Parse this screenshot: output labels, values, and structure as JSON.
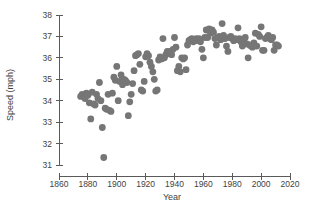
{
  "chart_data": {
    "type": "scatter",
    "title": "",
    "xlabel": "Year",
    "ylabel": "Speed (mph)",
    "xlim": [
      1860,
      2020
    ],
    "ylim": [
      31,
      38
    ],
    "xticks": [
      1860,
      1880,
      1900,
      1920,
      1940,
      1960,
      1980,
      2000,
      2020
    ],
    "yticks": [
      31,
      32,
      33,
      34,
      35,
      36,
      37,
      38
    ],
    "grid": false,
    "legend": null,
    "marker_color": "#767676",
    "marker_size": 3.4,
    "points": [
      [
        1875,
        34.2
      ],
      [
        1876,
        34.3
      ],
      [
        1877,
        34.2
      ],
      [
        1878,
        34.1
      ],
      [
        1879,
        34.35
      ],
      [
        1880,
        34.25
      ],
      [
        1881,
        33.9
      ],
      [
        1882,
        33.15
      ],
      [
        1883,
        34.4
      ],
      [
        1884,
        33.85
      ],
      [
        1885,
        33.8
      ],
      [
        1886,
        34.3
      ],
      [
        1887,
        34.1
      ],
      [
        1888,
        34.85
      ],
      [
        1889,
        34.0
      ],
      [
        1890,
        32.75
      ],
      [
        1891,
        31.35
      ],
      [
        1892,
        33.65
      ],
      [
        1893,
        33.6
      ],
      [
        1894,
        34.3
      ],
      [
        1895,
        33.55
      ],
      [
        1896,
        33.5
      ],
      [
        1897,
        34.35
      ],
      [
        1898,
        35.1
      ],
      [
        1899,
        34.95
      ],
      [
        1900,
        35.6
      ],
      [
        1901,
        34.0
      ],
      [
        1902,
        34.9
      ],
      [
        1903,
        35.2
      ],
      [
        1904,
        34.75
      ],
      [
        1905,
        35.0
      ],
      [
        1906,
        34.95
      ],
      [
        1907,
        34.85
      ],
      [
        1908,
        33.3
      ],
      [
        1909,
        33.95
      ],
      [
        1910,
        34.3
      ],
      [
        1911,
        34.8
      ],
      [
        1912,
        35.4
      ],
      [
        1913,
        36.1
      ],
      [
        1914,
        36.15
      ],
      [
        1915,
        36.2
      ],
      [
        1916,
        35.7
      ],
      [
        1917,
        34.5
      ],
      [
        1918,
        34.45
      ],
      [
        1919,
        34.9
      ],
      [
        1920,
        36.05
      ],
      [
        1921,
        36.2
      ],
      [
        1922,
        36.1
      ],
      [
        1923,
        35.8
      ],
      [
        1924,
        35.6
      ],
      [
        1925,
        35.35
      ],
      [
        1926,
        35.0
      ],
      [
        1927,
        34.45
      ],
      [
        1928,
        34.5
      ],
      [
        1929,
        35.9
      ],
      [
        1930,
        36.05
      ],
      [
        1931,
        35.95
      ],
      [
        1932,
        36.9
      ],
      [
        1933,
        36.0
      ],
      [
        1934,
        36.15
      ],
      [
        1935,
        36.3
      ],
      [
        1936,
        36.2
      ],
      [
        1937,
        36.3
      ],
      [
        1938,
        36.15
      ],
      [
        1939,
        36.4
      ],
      [
        1940,
        36.95
      ],
      [
        1941,
        36.5
      ],
      [
        1942,
        35.4
      ],
      [
        1943,
        35.6
      ],
      [
        1944,
        35.35
      ],
      [
        1945,
        36.0
      ],
      [
        1946,
        35.95
      ],
      [
        1947,
        36.0
      ],
      [
        1948,
        35.45
      ],
      [
        1949,
        36.6
      ],
      [
        1950,
        36.8
      ],
      [
        1951,
        36.85
      ],
      [
        1952,
        36.9
      ],
      [
        1953,
        36.75
      ],
      [
        1954,
        36.85
      ],
      [
        1955,
        36.9
      ],
      [
        1956,
        36.8
      ],
      [
        1957,
        36.9
      ],
      [
        1958,
        36.75
      ],
      [
        1959,
        36.4
      ],
      [
        1960,
        36.0
      ],
      [
        1961,
        36.95
      ],
      [
        1962,
        37.3
      ],
      [
        1963,
        36.95
      ],
      [
        1964,
        37.35
      ],
      [
        1965,
        37.15
      ],
      [
        1966,
        37.3
      ],
      [
        1967,
        37.2
      ],
      [
        1968,
        36.9
      ],
      [
        1969,
        36.6
      ],
      [
        1970,
        36.95
      ],
      [
        1971,
        37.0
      ],
      [
        1972,
        36.85
      ],
      [
        1973,
        37.6
      ],
      [
        1974,
        37.05
      ],
      [
        1975,
        36.9
      ],
      [
        1976,
        36.55
      ],
      [
        1977,
        36.3
      ],
      [
        1978,
        36.95
      ],
      [
        1979,
        37.0
      ],
      [
        1980,
        36.9
      ],
      [
        1981,
        36.8
      ],
      [
        1982,
        36.9
      ],
      [
        1983,
        36.85
      ],
      [
        1984,
        37.4
      ],
      [
        1985,
        36.9
      ],
      [
        1986,
        36.75
      ],
      [
        1987,
        36.55
      ],
      [
        1988,
        36.8
      ],
      [
        1989,
        36.95
      ],
      [
        1990,
        36.65
      ],
      [
        1991,
        36.0
      ],
      [
        1992,
        36.6
      ],
      [
        1993,
        36.55
      ],
      [
        1994,
        36.5
      ],
      [
        1995,
        36.7
      ],
      [
        1996,
        37.15
      ],
      [
        1997,
        36.55
      ],
      [
        1998,
        37.1
      ],
      [
        1999,
        37.0
      ],
      [
        2000,
        37.45
      ],
      [
        2001,
        36.35
      ],
      [
        2002,
        36.35
      ],
      [
        2003,
        36.9
      ],
      [
        2004,
        36.95
      ],
      [
        2005,
        37.05
      ],
      [
        2006,
        36.9
      ],
      [
        2007,
        36.85
      ],
      [
        2008,
        36.95
      ],
      [
        2009,
        36.35
      ],
      [
        2010,
        36.6
      ],
      [
        2011,
        36.6
      ],
      [
        2012,
        36.55
      ]
    ]
  },
  "axes": {
    "y_axis_label": "Speed (mph)",
    "x_axis_label": "Year"
  }
}
